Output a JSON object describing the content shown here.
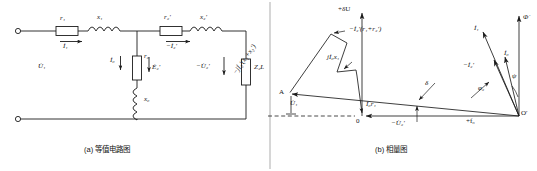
{
  "figure": {
    "divider_x": 270,
    "stroke": "#1c1c1c",
    "bg": "#ffffff"
  },
  "circuit": {
    "caption": "(a) 等值电路图",
    "series_branch": {
      "r1": "r₁",
      "x1": "x₁",
      "r2p": "r₂′",
      "x2p": "x₂′",
      "i1": "İ₁",
      "i2n": "−İ₂′"
    },
    "shunt_branch": {
      "r0": "r₀",
      "x0": "x₀",
      "i0": "İ₀",
      "e2p": "Ė₂′"
    },
    "load_branch": {
      "u2n": "−U̇₂′",
      "z2l": "Z₂L"
    },
    "source": {
      "u1": "U̇₁"
    },
    "terminals": [
      "input-top",
      "input-bottom"
    ]
  },
  "phasor": {
    "caption": "(b) 相量图",
    "axes": {
      "vertical_label": "+δU",
      "horizontal_label": "+f₀",
      "origin_label": "0",
      "vertex_label": "O′",
      "point_a_label": "A"
    },
    "vectors": [
      {
        "name": "flux",
        "label": "Φ̇"
      },
      {
        "name": "current-primary",
        "label": "İ₁"
      },
      {
        "name": "current-magnetizing",
        "label": "İ₀"
      },
      {
        "name": "current-secondary-neg",
        "label": "−İ₂′"
      },
      {
        "name": "voltage-primary",
        "label": "U̇₁"
      },
      {
        "name": "voltage-secondary-neg",
        "label": "−U̇₂′"
      }
    ],
    "drops": [
      {
        "name": "reactive-drop-series",
        "label": "−jİ₂′(x₁+x₂′)"
      },
      {
        "name": "resistive-drop-series",
        "label": "−İ₂′(r₁+r₂′)"
      },
      {
        "name": "reactance-drop-magnetizing",
        "label": "jİ₀x₁"
      },
      {
        "name": "resistive-drop-magnetizing",
        "label": "İ₀r₁"
      }
    ],
    "angles": [
      {
        "name": "angle-psi",
        "label": "ψ"
      },
      {
        "name": "angle-phi2",
        "label": "φ₂"
      },
      {
        "name": "angle-delta",
        "label": "δ"
      }
    ]
  }
}
